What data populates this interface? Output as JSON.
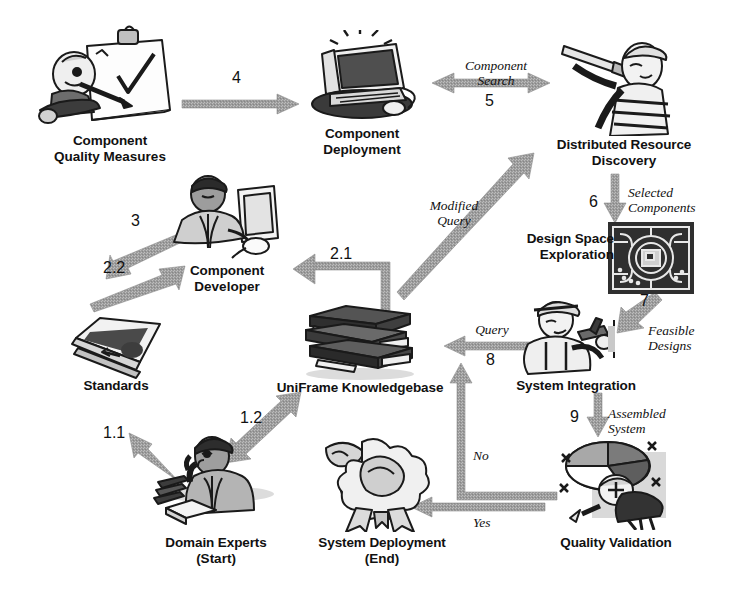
{
  "diagram": {
    "background_color": "#ffffff",
    "arrow_color": "#9a9a9a",
    "text_color": "#111111"
  },
  "nodes": [
    {
      "id": "component-quality-measures",
      "label_line1": "Component",
      "label_line2": "Quality Measures",
      "icon": "person-with-clipboard-checklist-icon"
    },
    {
      "id": "component-deployment",
      "label_line1": "Component",
      "label_line2": "Deployment",
      "icon": "desktop-computer-icon"
    },
    {
      "id": "distributed-resource-discovery",
      "label_line1": "Distributed Resource",
      "label_line2": "Discovery",
      "icon": "sailor-with-telescope-icon"
    },
    {
      "id": "design-space-exploration",
      "label_line1": "Design Space",
      "label_line2": "Exploration",
      "icon": "ornamental-circuit-tile-icon"
    },
    {
      "id": "component-developer",
      "label_line1": "Component",
      "label_line2": "Developer",
      "icon": "developer-at-computer-icon"
    },
    {
      "id": "system-integration",
      "label_line1": "System Integration",
      "label_line2": "",
      "icon": "worker-with-hammer-icon"
    },
    {
      "id": "standards",
      "label_line1": "Standards",
      "label_line2": "",
      "icon": "open-book-icon"
    },
    {
      "id": "uniframe-knowledgebase",
      "label_line1": "UniFrame Knowledgebase",
      "label_line2": "",
      "icon": "stack-of-books-icon"
    },
    {
      "id": "quality-validation",
      "label_line1": "Quality Validation",
      "label_line2": "",
      "icon": "pie-chart-with-inspector-icon"
    },
    {
      "id": "domain-experts",
      "label_line1": "Domain Experts",
      "label_line2": "(Start)",
      "icon": "expert-on-phone-with-books-icon"
    },
    {
      "id": "system-deployment",
      "label_line1": "System Deployment",
      "label_line2": "(End)",
      "icon": "award-ribbon-rosette-icon"
    }
  ],
  "arrows": [
    {
      "id": "arrow-4",
      "number": "4",
      "caption": "",
      "from": "component-quality-measures",
      "to": "component-deployment",
      "direction": "right"
    },
    {
      "id": "arrow-5-component-search",
      "number": "5",
      "caption_line1": "Component",
      "caption_line2": "Search",
      "from": "component-deployment",
      "to": "distributed-resource-discovery",
      "direction": "bidirectional"
    },
    {
      "id": "arrow-6-selected-components",
      "number": "6",
      "caption_line1": "Selected",
      "caption_line2": "Components",
      "from": "distributed-resource-discovery",
      "to": "design-space-exploration",
      "direction": "down"
    },
    {
      "id": "arrow-7-feasible-designs",
      "number": "7",
      "caption_line1": "Feasible",
      "caption_line2": "Designs",
      "from": "design-space-exploration",
      "to": "system-integration",
      "direction": "down-left"
    },
    {
      "id": "arrow-3",
      "number": "3",
      "caption": "",
      "from": "component-developer",
      "to": "component-quality-measures",
      "direction": "up-left"
    },
    {
      "id": "arrow-2-2",
      "number": "2.2",
      "caption": "",
      "from": "standards",
      "to": "component-developer",
      "direction": "up-right"
    },
    {
      "id": "arrow-2-1",
      "number": "2.1",
      "caption": "",
      "from": "uniframe-knowledgebase",
      "to": "component-developer",
      "direction": "elbow-up-left"
    },
    {
      "id": "arrow-modified-query",
      "number": "",
      "caption_line1": "Modified",
      "caption_line2": "Query",
      "from": "uniframe-knowledgebase",
      "to": "distributed-resource-discovery",
      "direction": "up-right"
    },
    {
      "id": "arrow-8-query",
      "number": "8",
      "caption_line1": "Query",
      "caption_line2": "",
      "from": "system-integration",
      "to": "uniframe-knowledgebase",
      "direction": "left"
    },
    {
      "id": "arrow-9-assembled-system",
      "number": "9",
      "caption_line1": "Assembled",
      "caption_line2": "System",
      "from": "system-integration",
      "to": "quality-validation",
      "direction": "down"
    },
    {
      "id": "arrow-1-1",
      "number": "1.1",
      "caption": "",
      "from": "domain-experts",
      "to": "standards",
      "direction": "up-left"
    },
    {
      "id": "arrow-1-2",
      "number": "1.2",
      "caption": "",
      "from": "domain-experts",
      "to": "uniframe-knowledgebase",
      "direction": "bidirectional-up-right"
    },
    {
      "id": "arrow-no",
      "number": "",
      "caption_line1": "No",
      "caption_line2": "",
      "from": "quality-validation",
      "to": "uniframe-knowledgebase",
      "direction": "elbow-up"
    },
    {
      "id": "arrow-yes",
      "number": "",
      "caption_line1": "Yes",
      "caption_line2": "",
      "from": "quality-validation",
      "to": "system-deployment",
      "direction": "left"
    }
  ]
}
